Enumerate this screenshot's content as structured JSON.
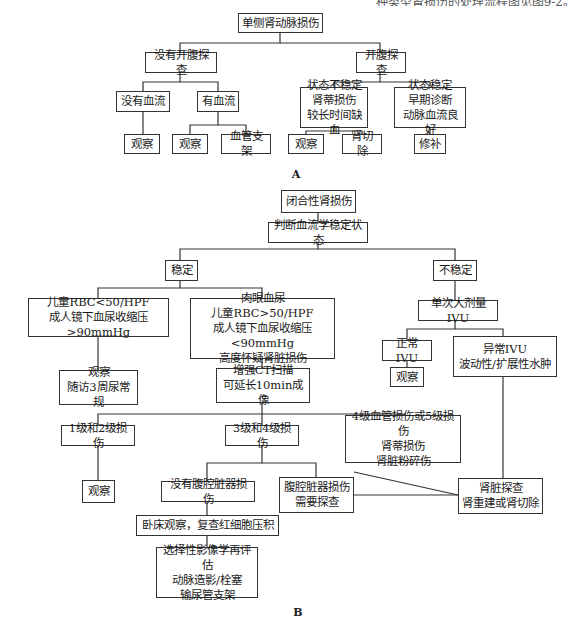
{
  "page": {
    "top_text_fragment": "种类型肾损伤的处理流程图见图9-2。"
  },
  "diagram_a": {
    "label": "A",
    "nodes": {
      "root": "单侧肾动脉损伤",
      "no_laparotomy": "没有开腹探查",
      "laparotomy": "开腹探查",
      "no_flow": "没有血流",
      "flow": "有血流",
      "unstable": "状态不稳定\n肾蒂损伤\n较长时间缺血",
      "stable": "状态稳定\n早期诊断\n动脉血流良好",
      "observe_1": "观察",
      "observe_2": "观察",
      "stent": "血管支架",
      "observe_3": "观察",
      "nephrectomy": "肾切除",
      "repair": "修补"
    }
  },
  "diagram_b": {
    "label": "B",
    "nodes": {
      "root": "闭合性肾损伤",
      "assess": "判断血流学稳定状态",
      "stable": "稳定",
      "unstable": "不稳定",
      "minor": "儿童RBC<50/HPF\n成人镜下血尿收缩压>90mmHg",
      "major": "肉眼血尿\n儿童RBC>50/HPF\n成人镜下血尿收缩压<90mmHg\n高度怀疑肾脏损伤",
      "ivu": "单次大剂量IVU",
      "observe_followup": "观察\n随访3周尿常规",
      "ct": "增强CT扫描\n可延长10min成像",
      "normal_ivu": "正常IVU",
      "abnormal_ivu": "异常IVU\n波动性/扩展性水肿",
      "observe_ivu": "观察",
      "grade12": "1级和2级损伤",
      "grade34": "3级和4级损伤",
      "grade45": "4级血管损伤或5级损伤\n肾蒂损伤\n肾脏粉碎伤",
      "observe_g12": "观察",
      "no_abdominal": "没有腹腔脏器损伤",
      "abdominal": "腹腔脏器损伤\n需要探查",
      "explore": "肾脏探查\n肾重建或肾切除",
      "bedrest": "卧床观察，复查红细胞压积",
      "reassess": "选择性影像学再评估\n动脉造影/栓塞\n输尿管支架"
    }
  }
}
